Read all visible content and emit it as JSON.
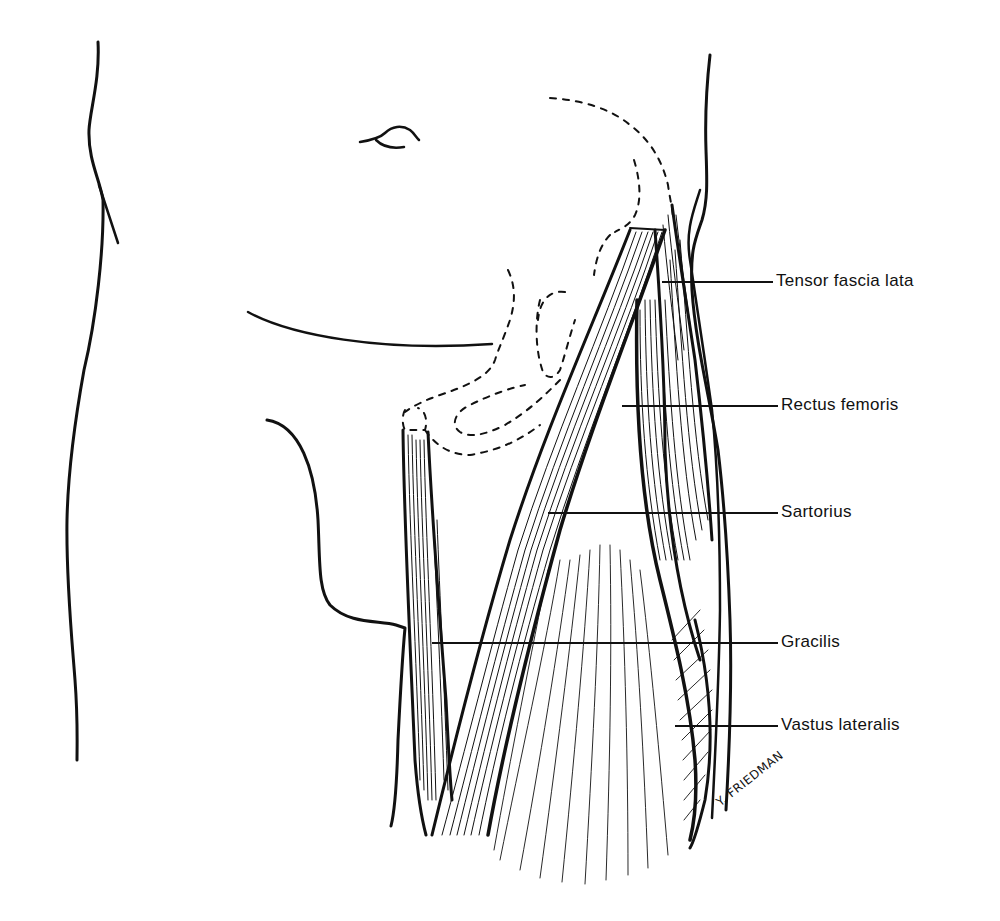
{
  "figure": {
    "colors": {
      "ink": "#111111",
      "background": "#ffffff"
    }
  },
  "labels": [
    {
      "id": "tensor",
      "text": "Tensor fascia lata",
      "y": 282,
      "line_x1": 662,
      "line_x2": 773
    },
    {
      "id": "rectus",
      "text": "Rectus femoris",
      "y": 406,
      "line_x1": 622,
      "line_x2": 778
    },
    {
      "id": "sartorius",
      "text": "Sartorius",
      "y": 513,
      "line_x1": 548,
      "line_x2": 778
    },
    {
      "id": "gracilis",
      "text": "Gracilis",
      "y": 643,
      "line_x1": 432,
      "line_x2": 778
    },
    {
      "id": "vastus",
      "text": "Vastus lateralis",
      "y": 726,
      "line_x1": 675,
      "line_x2": 778
    }
  ],
  "signature": {
    "text": "Y. FRIEDMAN"
  }
}
